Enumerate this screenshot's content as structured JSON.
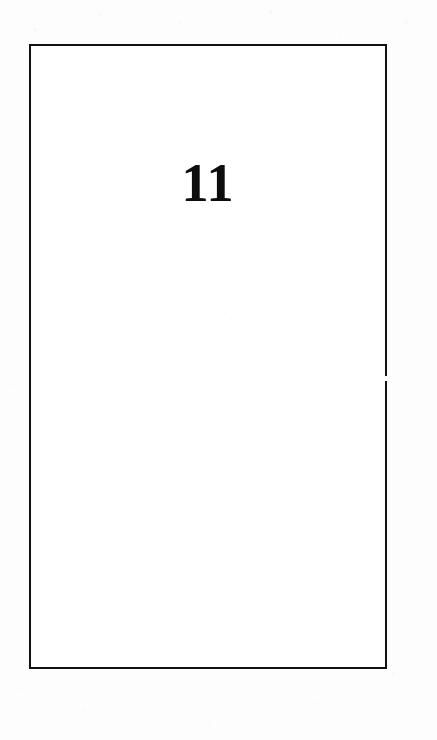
{
  "document": {
    "type": "scanned-book-page",
    "page_background_color": "#ffffff",
    "scan_margin_color": "#fdfdfd",
    "ink_color": "#111111"
  },
  "page": {
    "chapter_number": "11",
    "body_text": "",
    "header_text": "",
    "footer_text": "",
    "folio": ""
  },
  "frame": {
    "border_color": "#111111",
    "border_width_px": "2",
    "has_right_border_gap": "true"
  }
}
